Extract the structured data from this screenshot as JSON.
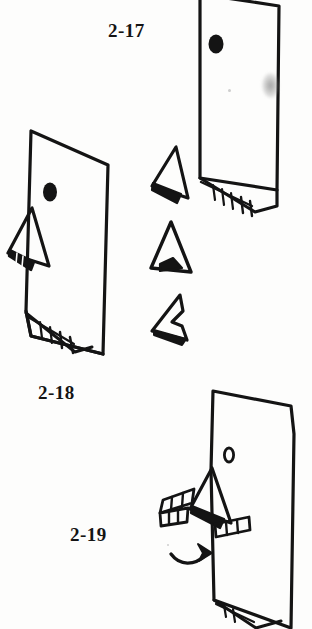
{
  "page": {
    "kind": "scanned-illustration-page",
    "background_color": "#fdfdfc",
    "ink_color": "#141414",
    "width": 312,
    "height": 629
  },
  "labels": {
    "fig_2_17": "2-17",
    "fig_2_18": "2-18",
    "fig_2_19": "2-19"
  },
  "figures": [
    {
      "id": "figure-2-17",
      "label": "2-17",
      "description": "Upright quadrilateral panel with a solid filled oval eye near upper left and a hatched fringe flap along the lower edge",
      "eye_style": "filled",
      "has_beak": false,
      "has_bottom_fringe": true
    },
    {
      "id": "figure-2-18",
      "label": "2-18",
      "description": "Upright quadrilateral panel with a solid filled oval eye, a triangular beak folded out at the left side with small hatch marks, and a hatched fringe flap along the lower edge",
      "eye_style": "filled",
      "has_beak": true,
      "has_bottom_fringe": true
    },
    {
      "id": "figure-2-19",
      "label": "2-19",
      "description": "Upright quadrilateral panel with a small open outlined oval eye, a triangular beak folded out at the left, two segmented fringe bands, a curved arrow pointing right, and a hatched flap along the lower edge",
      "eye_style": "outline",
      "has_beak": true,
      "has_bottom_fringe": true,
      "has_motion_arrow": true,
      "arrow_direction": "right"
    }
  ],
  "detail_shapes": {
    "beak_variants_caption": "Three detached beak shapes shown in a vertical column at center",
    "count": 3,
    "items": [
      {
        "id": "beak-variant-1",
        "description": "Narrow triangular beak with solid filled lower lobe"
      },
      {
        "id": "beak-variant-2",
        "description": "Rounded triangular beak with a small solid notch at the base"
      },
      {
        "id": "beak-variant-3",
        "description": "Stepped arrowhead beak with a notch on the right side"
      }
    ]
  },
  "marks": {
    "smudge": "grey ink smudge on right edge of figure 2-17",
    "specks": [
      "faint speck inside figure 2-17",
      "faint speck left of the arrow in figure 2-19"
    ]
  }
}
